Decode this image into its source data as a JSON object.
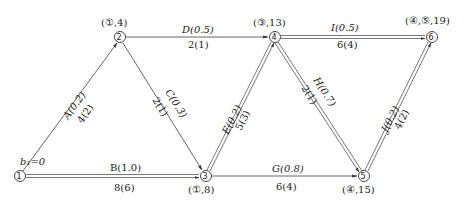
{
  "diagram": {
    "type": "network",
    "start_label": "b₁=0",
    "nodes": [
      {
        "id": "1",
        "symbol": "①",
        "x": 20,
        "y": 176,
        "label": ""
      },
      {
        "id": "2",
        "symbol": "②",
        "x": 120,
        "y": 37,
        "label": "(①,4)"
      },
      {
        "id": "3",
        "symbol": "③",
        "x": 206,
        "y": 176,
        "label": "(①,8)"
      },
      {
        "id": "4",
        "symbol": "④",
        "x": 275,
        "y": 37,
        "label": "(③,13)"
      },
      {
        "id": "5",
        "symbol": "⑤",
        "x": 364,
        "y": 176,
        "label": "(④,15)"
      },
      {
        "id": "6",
        "symbol": "⑥",
        "x": 432,
        "y": 37,
        "label": "(④,⑤,19)"
      }
    ],
    "edges": [
      {
        "from": "1",
        "to": "2",
        "name": "A(0.2)",
        "value": "4(2)",
        "critical": false
      },
      {
        "from": "1",
        "to": "3",
        "name": "B(1.0)",
        "value": "8(6)",
        "critical": true
      },
      {
        "from": "2",
        "to": "3",
        "name": "C(0.3)",
        "value": "2(1)",
        "critical": false
      },
      {
        "from": "2",
        "to": "4",
        "name": "D(0.5)",
        "value": "2(1)",
        "critical": false
      },
      {
        "from": "3",
        "to": "4",
        "name": "E(0.2)",
        "value": "5(3)",
        "critical": true
      },
      {
        "from": "3",
        "to": "5",
        "name": "G(0.8)",
        "value": "6(4)",
        "critical": false
      },
      {
        "from": "4",
        "to": "5",
        "name": "H(0.7)",
        "value": "2(1)",
        "critical": true
      },
      {
        "from": "4",
        "to": "6",
        "name": "I(0.5)",
        "value": "6(4)",
        "critical": true
      },
      {
        "from": "5",
        "to": "6",
        "name": "J(0.2)",
        "value": "4(2)",
        "critical": true
      }
    ]
  }
}
